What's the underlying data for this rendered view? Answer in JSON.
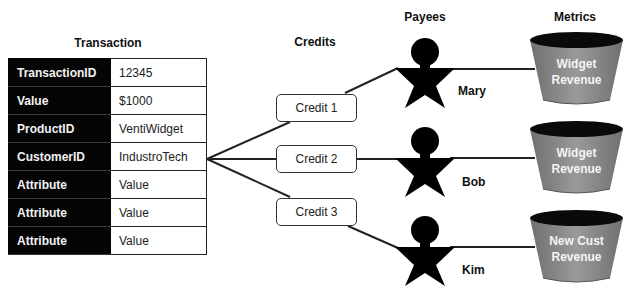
{
  "transaction": {
    "title": "Transaction",
    "rows": [
      {
        "key": "TransactionID",
        "value": "12345"
      },
      {
        "key": "Value",
        "value": "$1000"
      },
      {
        "key": "ProductID",
        "value": "VentiWidget"
      },
      {
        "key": "CustomerID",
        "value": "IndustroTech"
      },
      {
        "key": "Attribute",
        "value": "Value"
      },
      {
        "key": "Attribute",
        "value": "Value"
      },
      {
        "key": "Attribute",
        "value": "Value"
      }
    ]
  },
  "credits": {
    "title": "Credits",
    "items": [
      {
        "label": "Credit 1"
      },
      {
        "label": "Credit 2"
      },
      {
        "label": "Credit 3"
      }
    ]
  },
  "payees": {
    "title": "Payees",
    "items": [
      {
        "name": "Mary",
        "icon": "person-star-icon"
      },
      {
        "name": "Bob",
        "icon": "person-star-icon"
      },
      {
        "name": "Kim",
        "icon": "person-star-icon"
      }
    ]
  },
  "metrics": {
    "title": "Metrics",
    "items": [
      {
        "line1": "Widget",
        "line2": "Revenue",
        "icon": "bucket-icon"
      },
      {
        "line1": "Widget",
        "line2": "Revenue",
        "icon": "bucket-icon"
      },
      {
        "line1": "New Cust",
        "line2": "Revenue",
        "icon": "bucket-icon"
      }
    ]
  },
  "colors": {
    "table_key_bg": "#050505",
    "bucket_body": "#8c8c8c",
    "bucket_top": "#0a0a0a",
    "figure": "#000000",
    "line": "#222222"
  }
}
